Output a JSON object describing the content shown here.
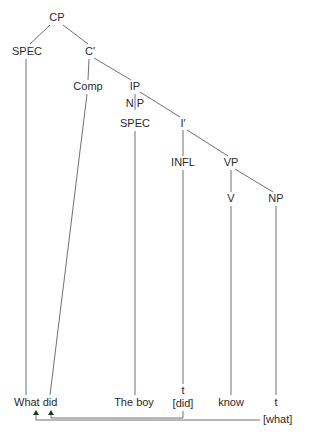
{
  "diagram": {
    "type": "syntax-tree",
    "colors": {
      "text": "#2a2a2a",
      "edge": "#6f6f78",
      "arrowhead": "#1f3a1f",
      "background": "#ffffff"
    },
    "nodes": [
      {
        "id": "cp",
        "label": "CP",
        "x": 57,
        "y": 18
      },
      {
        "id": "spec1",
        "label": "SPEC",
        "x": 27,
        "y": 52
      },
      {
        "id": "cbar",
        "label": "C′",
        "x": 90,
        "y": 52
      },
      {
        "id": "comp",
        "label": "Comp",
        "x": 88,
        "y": 87
      },
      {
        "id": "ip",
        "label": "IP",
        "x": 135,
        "y": 87
      },
      {
        "id": "np1",
        "label": "N P",
        "x": 135,
        "y": 104
      },
      {
        "id": "spec2",
        "label": "SPEC",
        "x": 135,
        "y": 124
      },
      {
        "id": "ibar",
        "label": "I′",
        "x": 183,
        "y": 124
      },
      {
        "id": "infl",
        "label": "INFL",
        "x": 183,
        "y": 163
      },
      {
        "id": "vp",
        "label": "VP",
        "x": 231,
        "y": 163
      },
      {
        "id": "v",
        "label": "V",
        "x": 231,
        "y": 199
      },
      {
        "id": "np2",
        "label": "NP",
        "x": 276,
        "y": 199
      }
    ],
    "edges": [
      {
        "x1": 50,
        "y1": 25,
        "x2": 30,
        "y2": 44
      },
      {
        "x1": 63,
        "y1": 25,
        "x2": 88,
        "y2": 44
      },
      {
        "x1": 89,
        "y1": 59,
        "x2": 88,
        "y2": 80
      },
      {
        "x1": 94,
        "y1": 58,
        "x2": 131,
        "y2": 80
      },
      {
        "x1": 140,
        "y1": 92,
        "x2": 180,
        "y2": 117
      },
      {
        "x1": 135,
        "y1": 94,
        "x2": 135,
        "y2": 110
      },
      {
        "x1": 187,
        "y1": 130,
        "x2": 228,
        "y2": 156
      },
      {
        "x1": 183,
        "y1": 130,
        "x2": 183,
        "y2": 156
      },
      {
        "x1": 235,
        "y1": 169,
        "x2": 273,
        "y2": 192
      },
      {
        "x1": 231,
        "y1": 170,
        "x2": 231,
        "y2": 192
      },
      {
        "x1": 26,
        "y1": 59,
        "x2": 26,
        "y2": 395
      },
      {
        "x1": 87,
        "y1": 94,
        "x2": 50,
        "y2": 395
      },
      {
        "x1": 135,
        "y1": 131,
        "x2": 135,
        "y2": 395
      },
      {
        "x1": 183,
        "y1": 170,
        "x2": 183,
        "y2": 384
      },
      {
        "x1": 231,
        "y1": 206,
        "x2": 231,
        "y2": 395
      },
      {
        "x1": 276,
        "y1": 206,
        "x2": 276,
        "y2": 395
      }
    ],
    "leaves": [
      {
        "id": "what-did",
        "label": "What did",
        "x": 14,
        "y": 403,
        "anchor": "start"
      },
      {
        "id": "the-boy",
        "label": "The boy",
        "x": 134,
        "y": 403,
        "anchor": "middle"
      },
      {
        "id": "t-did-trace",
        "label": "t",
        "x": 183,
        "y": 391,
        "anchor": "middle"
      },
      {
        "id": "did-bracket",
        "label": "[did]",
        "x": 183,
        "y": 404,
        "anchor": "middle"
      },
      {
        "id": "know",
        "label": "know",
        "x": 231,
        "y": 403,
        "anchor": "middle"
      },
      {
        "id": "t-what-trace",
        "label": "t",
        "x": 276,
        "y": 403,
        "anchor": "middle"
      },
      {
        "id": "what-bracket",
        "label": "[what]",
        "x": 263,
        "y": 420,
        "anchor": "start"
      }
    ],
    "movement_arrows": [
      {
        "name": "did-movement-arrow",
        "points": "183,411 183,418 51,418 51,414",
        "head": {
          "x": 51,
          "y": 410
        }
      },
      {
        "name": "what-movement-arrow",
        "points": "260,420 36,420 36,414",
        "head": {
          "x": 36,
          "y": 410
        }
      }
    ]
  }
}
